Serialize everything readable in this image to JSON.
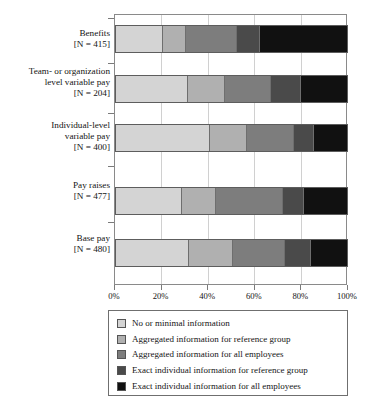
{
  "chart_data": {
    "type": "bar",
    "orientation": "horizontal",
    "stacked": true,
    "normalized": true,
    "title": "",
    "xlabel": "",
    "ylabel": "",
    "xlim": [
      0,
      100
    ],
    "xticks": [
      0,
      20,
      40,
      60,
      80,
      100
    ],
    "xticklabels": [
      "0%",
      "20%",
      "40%",
      "60%",
      "80%",
      "100%"
    ],
    "grid": true,
    "grid_axis": "x",
    "legend_position": "below",
    "categories": [
      {
        "name": "Benefits",
        "n_label": "[N = 415]",
        "n": 415
      },
      {
        "name": "Team- or organization\nlevel variable pay",
        "n_label": "[N = 204]",
        "n": 204
      },
      {
        "name": "Individual-level\nvariable pay",
        "n_label": "[N = 400]",
        "n": 400
      },
      {
        "name": "Pay raises",
        "n_label": "[N = 477]",
        "n": 477
      },
      {
        "name": "Base pay",
        "n_label": "[N = 480]",
        "n": 480
      }
    ],
    "series": [
      {
        "name": "No or minimal information",
        "color": "#d4d4d4",
        "values": [
          20.5,
          31.0,
          40.5,
          28.5,
          31.5
        ]
      },
      {
        "name": "Aggregated information for reference group",
        "color": "#b0b0b0",
        "values": [
          10.0,
          16.0,
          16.0,
          15.0,
          19.0
        ]
      },
      {
        "name": "Aggregated information for all employees",
        "color": "#7d7d7d",
        "values": [
          22.0,
          20.0,
          20.5,
          29.0,
          22.5
        ]
      },
      {
        "name": "Exact individual information for reference group",
        "color": "#4a4a4a",
        "values": [
          10.0,
          13.0,
          8.5,
          9.0,
          11.5
        ]
      },
      {
        "name": "Exact individual information for all employees",
        "color": "#111111",
        "values": [
          37.5,
          20.0,
          14.5,
          18.5,
          15.5
        ]
      }
    ]
  },
  "legend": {
    "items": [
      {
        "label": "No or minimal information",
        "color": "#d4d4d4"
      },
      {
        "label": "Aggregated information for reference group",
        "color": "#b0b0b0"
      },
      {
        "label": "Aggregated information for all employees",
        "color": "#7d7d7d"
      },
      {
        "label": "Exact individual information for reference group",
        "color": "#4a4a4a"
      },
      {
        "label": "Exact individual information for all employees",
        "color": "#111111"
      }
    ]
  }
}
